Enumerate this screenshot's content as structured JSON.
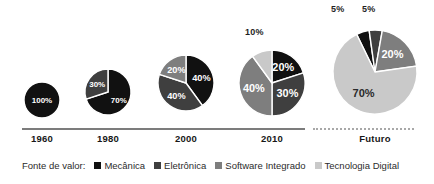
{
  "chart_data": {
    "type": "pie",
    "title": "",
    "subtitle": "",
    "xlabel": "",
    "ylabel": "",
    "grid": false,
    "legend_position": "bottom",
    "legend_title": "Fonte de valor:",
    "categories": [
      "Mecânica",
      "Eletrônica",
      "Software Integrado",
      "Tecnologia Digital"
    ],
    "colors": [
      "#111111",
      "#3f3f3f",
      "#7e7e7e",
      "#c9c9c9"
    ],
    "axis": {
      "solid_through": "2010",
      "dotted_to": "Futuro"
    },
    "periods": [
      "1960",
      "1980",
      "2000",
      "2010",
      "Futuro"
    ],
    "charts": [
      {
        "period": "1960",
        "radius_px": 18,
        "slices": [
          {
            "category": "Mecânica",
            "value": 100,
            "label": "100%",
            "color": "#111111",
            "label_placement": "inside"
          }
        ]
      },
      {
        "period": "1980",
        "radius_px": 23,
        "slices": [
          {
            "category": "Mecânica",
            "value": 70,
            "label": "70%",
            "color": "#111111",
            "label_placement": "inside"
          },
          {
            "category": "Eletrônica",
            "value": 30,
            "label": "30%",
            "color": "#3f3f3f",
            "label_placement": "inside"
          }
        ]
      },
      {
        "period": "2000",
        "radius_px": 28,
        "slices": [
          {
            "category": "Mecânica",
            "value": 40,
            "label": "40%",
            "color": "#111111",
            "label_placement": "inside"
          },
          {
            "category": "Eletrônica",
            "value": 40,
            "label": "40%",
            "color": "#3f3f3f",
            "label_placement": "inside"
          },
          {
            "category": "Software Integrado",
            "value": 20,
            "label": "20%",
            "color": "#7e7e7e",
            "label_placement": "inside"
          }
        ]
      },
      {
        "period": "2010",
        "radius_px": 33,
        "slices": [
          {
            "category": "Mecânica",
            "value": 20,
            "label": "20%",
            "color": "#111111",
            "label_placement": "inside"
          },
          {
            "category": "Eletrônica",
            "value": 30,
            "label": "30%",
            "color": "#3f3f3f",
            "label_placement": "inside"
          },
          {
            "category": "Software Integrado",
            "value": 40,
            "label": "40%",
            "color": "#7e7e7e",
            "label_placement": "inside"
          },
          {
            "category": "Tecnologia Digital",
            "value": 10,
            "label": "10%",
            "color": "#c9c9c9",
            "label_placement": "callout"
          }
        ]
      },
      {
        "period": "Futuro",
        "radius_px": 42,
        "slices": [
          {
            "category": "Mecânica",
            "value": 5,
            "label": "5%",
            "color": "#111111",
            "label_placement": "callout"
          },
          {
            "category": "Eletrônica",
            "value": 5,
            "label": "5%",
            "color": "#3f3f3f",
            "label_placement": "callout"
          },
          {
            "category": "Software Integrado",
            "value": 20,
            "label": "20%",
            "color": "#7e7e7e",
            "label_placement": "inside"
          },
          {
            "category": "Tecnologia Digital",
            "value": 70,
            "label": "70%",
            "color": "#c9c9c9",
            "label_placement": "inside"
          }
        ]
      }
    ]
  },
  "legend": {
    "title": "Fonte de valor:",
    "items": [
      {
        "label": "Mecânica",
        "color": "#111111"
      },
      {
        "label": "Eletrônica",
        "color": "#3f3f3f"
      },
      {
        "label": "Software Integrado",
        "color": "#7e7e7e"
      },
      {
        "label": "Tecnologia Digital",
        "color": "#c9c9c9"
      }
    ]
  },
  "axis_labels": [
    {
      "text": "1960"
    },
    {
      "text": "1980"
    },
    {
      "text": "2000"
    },
    {
      "text": "2010"
    },
    {
      "text": "Futuro"
    }
  ],
  "callouts": [
    {
      "text": "10%"
    },
    {
      "text": "5%"
    },
    {
      "text": "5%"
    }
  ]
}
